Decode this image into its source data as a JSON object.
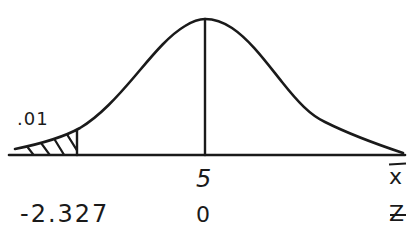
{
  "diagram": {
    "type": "normal-distribution-sketch",
    "style": "hand-drawn",
    "stroke_color": "#1a1a1a",
    "background": "#ffffff",
    "labels": {
      "tail_probability": ".01",
      "mean_xbar_value": "5",
      "mean_z_value": "0",
      "critical_z_value": "-2.327",
      "axis_xbar_label": "x",
      "axis_z_label": "Z"
    },
    "shaded_region": {
      "side": "left",
      "area": ".01",
      "boundary_z": "-2.327"
    },
    "center_line": {
      "x_bar": "5",
      "z": "0"
    }
  }
}
